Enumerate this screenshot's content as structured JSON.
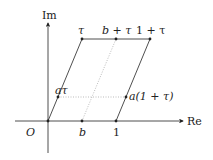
{
  "axes": {
    "x_label": "Re",
    "y_label": "Im",
    "origin_label": "O"
  },
  "points": {
    "tau": "τ",
    "b_plus_tau": "b + τ",
    "one_plus_tau": "1 + τ",
    "a_tau": "aτ",
    "a_one_plus_tau": "a(1 + τ)",
    "b": "b",
    "one": "1"
  },
  "colors": {
    "line": "#222222",
    "dotted": "#999999"
  }
}
